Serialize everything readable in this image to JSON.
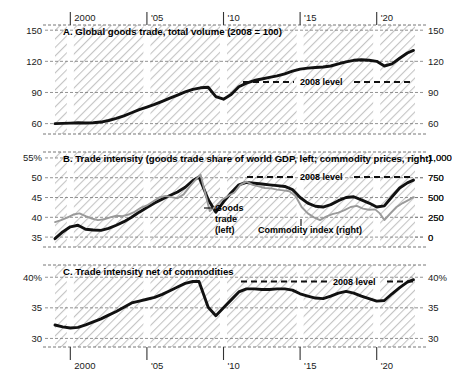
{
  "figure": {
    "width": 454,
    "height": 383,
    "background": "#ffffff",
    "hatch_color": "#c9c9c9",
    "series_color_dark": "#111111",
    "series_color_gray": "#9a9a9a",
    "axis_color": "#555555"
  },
  "xaxis": {
    "ticks": [
      {
        "label": "2000",
        "year": 2000
      },
      {
        "label": "'05",
        "year": 2005
      },
      {
        "label": "'10",
        "year": 2010
      },
      {
        "label": "'15",
        "year": 2015
      },
      {
        "label": "'20",
        "year": 2020
      }
    ],
    "range": [
      1999.0,
      2022.5
    ]
  },
  "panels": [
    {
      "id": "A",
      "title": "A. Global goods trade, total volume (2008 = 100)",
      "ylabels_left": [
        "150",
        "120",
        "90",
        "60"
      ],
      "ylabels_right": [
        "150",
        "120",
        "90",
        "60"
      ],
      "ylim": [
        50,
        155
      ],
      "yticks": [
        60,
        90,
        120,
        150
      ],
      "reference_line": {
        "label": "2008 level",
        "value": 100
      }
    },
    {
      "id": "B",
      "title": "B. Trade intensity (goods trade share of world GDP, left; commodity prices, right)",
      "ylabels_left": [
        "55%",
        "50",
        "45",
        "40",
        "35"
      ],
      "ylabels_right": [
        "1,000",
        "750",
        "500",
        "250",
        "0"
      ],
      "ylim_left": [
        32.5,
        56.5
      ],
      "yticks_left": [
        35,
        40,
        45,
        50,
        55
      ],
      "ylim_right": [
        -125,
        1075
      ],
      "yticks_right": [
        0,
        250,
        500,
        750,
        1000
      ],
      "reference_line": {
        "label": "2008 level",
        "value": 50.2
      },
      "annotations": [
        {
          "name": "goods-trade-left",
          "lines": [
            "Goods",
            "trade",
            "(left)"
          ]
        },
        {
          "name": "commodity-index-right",
          "lines": [
            "Commodity index (right)"
          ]
        }
      ]
    },
    {
      "id": "C",
      "title": "C. Trade intensity net of commodities",
      "ylabels_left": [
        "40%",
        "35",
        "30"
      ],
      "ylabels_right": [
        "40%",
        "35",
        "30"
      ],
      "ylim": [
        28.6,
        42.0
      ],
      "yticks": [
        30,
        35,
        40
      ],
      "reference_line": {
        "label": "2008 level",
        "value": 39.3
      }
    }
  ],
  "chart_data": [
    {
      "type": "line",
      "panel": "A",
      "title": "A. Global goods trade, total volume (2008 = 100)",
      "xlabel": "",
      "ylabel": "Index, 2008 = 100",
      "ylim": [
        50,
        155
      ],
      "yticks": [
        60,
        90,
        120,
        150
      ],
      "grid": true,
      "legend": "none",
      "series": [
        {
          "name": "Global goods trade, total volume",
          "color": "#111111",
          "x": [
            1999.0,
            1999.5,
            2000.0,
            2000.5,
            2001.0,
            2001.5,
            2002.0,
            2002.5,
            2003.0,
            2003.5,
            2004.0,
            2004.5,
            2005.0,
            2005.5,
            2006.0,
            2006.5,
            2007.0,
            2007.5,
            2008.0,
            2008.5,
            2009.0,
            2009.5,
            2010.0,
            2010.5,
            2011.0,
            2011.5,
            2012.0,
            2012.5,
            2013.0,
            2013.5,
            2014.0,
            2014.5,
            2015.0,
            2015.5,
            2016.0,
            2016.5,
            2017.0,
            2017.5,
            2018.0,
            2018.5,
            2019.0,
            2019.5,
            2020.0,
            2020.5,
            2021.0,
            2021.5,
            2022.0,
            2022.4
          ],
          "y": [
            60.0,
            60.2,
            60.5,
            60.8,
            60.6,
            60.8,
            61.5,
            63.0,
            65.0,
            67.5,
            70.5,
            73.5,
            76.0,
            78.5,
            81.5,
            84.5,
            87.5,
            90.5,
            93.0,
            94.5,
            95.0,
            86.0,
            83.5,
            88.0,
            95.5,
            99.0,
            101.5,
            103.0,
            104.5,
            106.0,
            108.0,
            110.5,
            112.5,
            113.5,
            114.0,
            114.5,
            115.5,
            117.5,
            119.5,
            121.0,
            121.5,
            121.0,
            120.0,
            115.5,
            117.5,
            123.0,
            128.0,
            130.5
          ]
        }
      ],
      "reference_lines": [
        {
          "label": "2008 level",
          "y": 100,
          "style": "dashed",
          "color": "#111111"
        }
      ]
    },
    {
      "type": "line",
      "panel": "B",
      "title": "B. Trade intensity (goods trade share of world GDP, left; commodity prices, right)",
      "xlabel": "",
      "ylabel_left": "Goods trade share of world GDP (%)",
      "ylabel_right": "Commodity price index",
      "ylim_left": [
        32.5,
        56.5
      ],
      "yticks_left": [
        35,
        40,
        45,
        50,
        55
      ],
      "ylim_right": [
        -125,
        1075
      ],
      "yticks_right": [
        0,
        250,
        500,
        750,
        1000
      ],
      "grid": true,
      "legend": "inline-annotations",
      "series": [
        {
          "name": "Goods trade (left)",
          "axis": "left",
          "color": "#111111",
          "x": [
            1999.0,
            1999.5,
            2000.0,
            2000.5,
            2001.0,
            2001.5,
            2002.0,
            2002.5,
            2003.0,
            2003.5,
            2004.0,
            2004.5,
            2005.0,
            2005.5,
            2006.0,
            2006.5,
            2007.0,
            2007.5,
            2008.0,
            2008.4,
            2009.0,
            2009.5,
            2010.0,
            2010.5,
            2011.0,
            2011.5,
            2012.0,
            2012.5,
            2013.0,
            2013.5,
            2014.0,
            2014.5,
            2015.0,
            2015.5,
            2016.0,
            2016.5,
            2017.0,
            2017.5,
            2018.0,
            2018.5,
            2019.0,
            2019.5,
            2020.0,
            2020.5,
            2021.0,
            2021.5,
            2022.0,
            2022.4
          ],
          "y": [
            34.6,
            36.3,
            37.6,
            38.0,
            37.0,
            36.8,
            36.7,
            37.2,
            38.0,
            38.9,
            40.0,
            41.3,
            42.5,
            43.6,
            44.6,
            45.5,
            46.4,
            47.6,
            49.3,
            50.2,
            44.5,
            41.3,
            43.9,
            46.2,
            48.2,
            48.8,
            48.6,
            48.4,
            48.2,
            48.0,
            47.8,
            47.0,
            45.0,
            43.6,
            42.8,
            42.6,
            43.2,
            44.2,
            45.0,
            45.2,
            44.4,
            43.6,
            42.6,
            42.9,
            45.2,
            47.4,
            48.7,
            49.4
          ]
        },
        {
          "name": "Commodity index (right)",
          "axis": "right",
          "color": "#9a9a9a",
          "x": [
            1999.0,
            1999.4,
            1999.8,
            2000.2,
            2000.6,
            2001.0,
            2001.4,
            2001.8,
            2002.2,
            2002.6,
            2003.0,
            2003.4,
            2003.8,
            2004.2,
            2004.6,
            2005.0,
            2005.4,
            2005.8,
            2006.2,
            2006.6,
            2007.0,
            2007.4,
            2007.8,
            2008.2,
            2008.5,
            2008.8,
            2009.1,
            2009.5,
            2009.9,
            2010.3,
            2010.7,
            2011.1,
            2011.5,
            2011.9,
            2012.3,
            2012.7,
            2013.1,
            2013.5,
            2013.9,
            2014.3,
            2014.7,
            2015.1,
            2015.5,
            2015.9,
            2016.3,
            2016.7,
            2017.1,
            2017.5,
            2017.9,
            2018.3,
            2018.7,
            2019.1,
            2019.5,
            2019.9,
            2020.2,
            2020.5,
            2020.9,
            2021.3,
            2021.7,
            2022.1,
            2022.4
          ],
          "y": [
            190,
            215,
            245,
            285,
            300,
            265,
            235,
            215,
            225,
            250,
            270,
            265,
            285,
            320,
            370,
            400,
            450,
            500,
            520,
            505,
            490,
            540,
            640,
            730,
            790,
            560,
            330,
            390,
            470,
            520,
            560,
            660,
            700,
            660,
            640,
            620,
            615,
            600,
            590,
            580,
            520,
            380,
            300,
            250,
            215,
            260,
            290,
            310,
            340,
            380,
            395,
            360,
            345,
            350,
            300,
            215,
            300,
            380,
            430,
            470,
            505
          ]
        }
      ],
      "reference_lines": [
        {
          "label": "2008 level",
          "y_left": 50.2,
          "style": "dashed",
          "color": "#111111"
        }
      ]
    },
    {
      "type": "line",
      "panel": "C",
      "title": "C. Trade intensity net of commodities",
      "xlabel": "",
      "ylabel": "Percent of world GDP",
      "ylim": [
        28.6,
        42.0
      ],
      "yticks": [
        30,
        35,
        40
      ],
      "grid": true,
      "legend": "none",
      "series": [
        {
          "name": "Trade intensity net of commodities",
          "color": "#111111",
          "x": [
            1999.0,
            1999.5,
            2000.0,
            2000.5,
            2001.0,
            2001.5,
            2002.0,
            2002.5,
            2003.0,
            2003.5,
            2004.0,
            2004.5,
            2005.0,
            2005.5,
            2006.0,
            2006.5,
            2007.0,
            2007.5,
            2008.0,
            2008.4,
            2009.0,
            2009.5,
            2010.0,
            2010.5,
            2011.0,
            2011.5,
            2012.0,
            2012.5,
            2013.0,
            2013.5,
            2014.0,
            2014.5,
            2015.0,
            2015.5,
            2016.0,
            2016.5,
            2017.0,
            2017.5,
            2018.0,
            2018.5,
            2019.0,
            2019.5,
            2020.0,
            2020.5,
            2021.0,
            2021.5,
            2022.0,
            2022.4
          ],
          "y": [
            32.2,
            31.9,
            31.7,
            31.8,
            32.2,
            32.7,
            33.2,
            33.8,
            34.4,
            35.1,
            35.8,
            36.1,
            36.4,
            36.7,
            37.2,
            37.8,
            38.4,
            39.0,
            39.3,
            39.3,
            35.1,
            33.7,
            35.0,
            36.3,
            37.6,
            38.1,
            38.1,
            38.0,
            38.0,
            38.1,
            38.1,
            37.9,
            37.3,
            36.9,
            36.6,
            36.5,
            36.9,
            37.4,
            37.7,
            37.4,
            36.9,
            36.5,
            36.1,
            36.2,
            37.3,
            38.3,
            39.2,
            39.6
          ]
        }
      ],
      "reference_lines": [
        {
          "label": "2008 level",
          "y": 39.3,
          "style": "dashed",
          "color": "#111111"
        }
      ]
    }
  ]
}
